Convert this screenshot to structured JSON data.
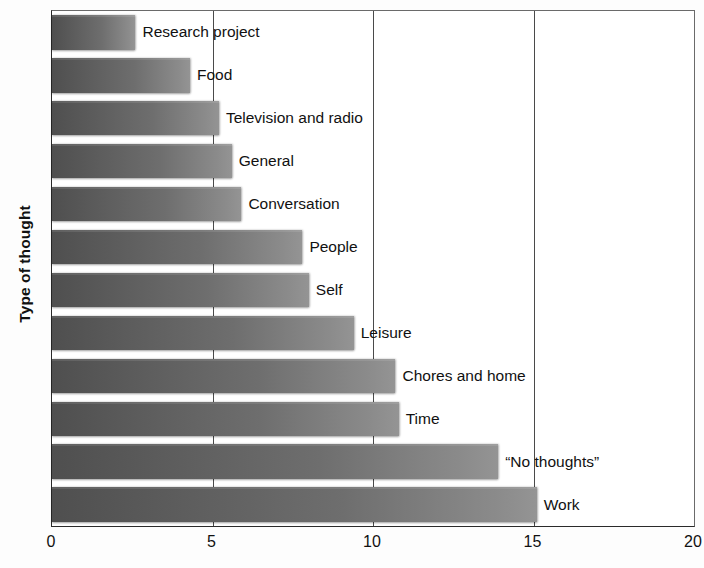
{
  "chart_data": {
    "type": "bar",
    "orientation": "horizontal",
    "title": "",
    "xlabel": "",
    "ylabel": "Type of thought",
    "xlim": [
      0,
      20
    ],
    "xticks": [
      "0",
      "5",
      "10",
      "15",
      "20"
    ],
    "xtick_values": [
      0,
      5,
      10,
      15,
      20
    ],
    "grid": "vertical",
    "legend": "none",
    "categories": [
      "Research project",
      "Food",
      "Television and radio",
      "General",
      "Conversation",
      "People",
      "Self",
      "Leisure",
      "Chores and home",
      "Time",
      "“No thoughts”",
      "Work"
    ],
    "values": [
      2.6,
      4.3,
      5.2,
      5.6,
      5.9,
      7.8,
      8.0,
      9.4,
      10.7,
      10.8,
      13.9,
      15.1
    ],
    "bar_color_left": "#4f4f4f",
    "bar_color_right": "#949494",
    "axis_color": "#2a2a2a",
    "grid_color": "#4a4a4a",
    "background": "#ffffff"
  }
}
